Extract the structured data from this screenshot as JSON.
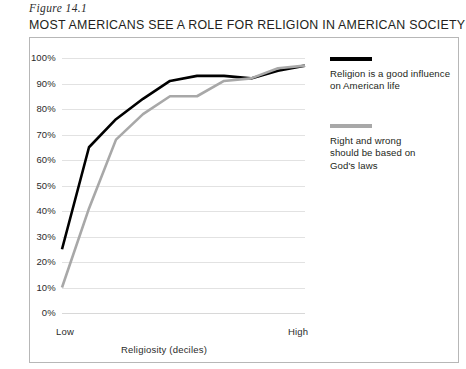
{
  "figure_label": "Figure 14.1",
  "title": "MOST AMERICANS SEE A ROLE FOR RELIGION IN AMERICAN SOCIETY",
  "axis": {
    "x_low_label": "Low",
    "x_high_label": "High",
    "x_title": "Religiosity (deciles)"
  },
  "legend": [
    {
      "label": "Religion is a good influence\non American life",
      "color": "#000000"
    },
    {
      "label": "Right and wrong\nshould be based on\nGod's laws",
      "color": "#a8a8a8"
    }
  ],
  "chart_data": {
    "type": "line",
    "title": "MOST AMERICANS SEE A ROLE FOR RELIGION IN AMERICAN SOCIETY",
    "xlabel": "Religiosity (deciles)",
    "ylabel": "",
    "ylim": [
      0,
      100
    ],
    "ytick_labels": [
      "100%",
      "90%",
      "80%",
      "70%",
      "60%",
      "50%",
      "40%",
      "30%",
      "20%",
      "10%",
      "0%"
    ],
    "ytick_values": [
      100,
      90,
      80,
      70,
      60,
      50,
      40,
      30,
      20,
      10,
      0
    ],
    "xtick_labels": [
      "Low",
      "High"
    ],
    "grid": true,
    "legend_position": "right",
    "categories": [
      1,
      2,
      3,
      4,
      5,
      6,
      7,
      8,
      9,
      10
    ],
    "series": [
      {
        "name": "Religion is a good influence on American life",
        "color": "#000000",
        "values": [
          25,
          65,
          76,
          84,
          91,
          93,
          93,
          92,
          95,
          97
        ]
      },
      {
        "name": "Right and wrong should be based on God's laws",
        "color": "#a8a8a8",
        "values": [
          10,
          41,
          68,
          78,
          85,
          85,
          91,
          92,
          96,
          97
        ]
      }
    ]
  }
}
